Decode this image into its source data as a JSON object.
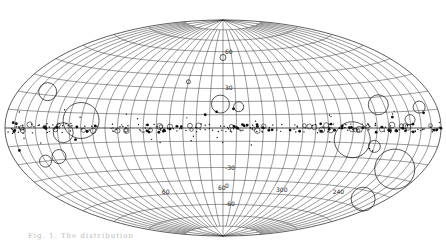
{
  "figure": {
    "projection": "Hammer-Aitoff galactic coordinates",
    "caption": "Fig. 1.  The distribution",
    "latitude_labels": [
      {
        "value": "60",
        "lon": 0,
        "lat": 60
      },
      {
        "value": "30",
        "lon": 0,
        "lat": 30
      },
      {
        "value": "-30",
        "lon": 0,
        "lat": -30
      },
      {
        "value": "0",
        "lon": 0,
        "lat": -45
      },
      {
        "value": "-60",
        "lon": 0,
        "lat": -60
      }
    ],
    "longitude_labels": [
      {
        "value": "60",
        "lon": 60,
        "lat": -50
      },
      {
        "value": "60",
        "lon": 0,
        "lat": -48
      },
      {
        "value": "300",
        "lon": -60,
        "lat": -48
      },
      {
        "value": "240",
        "lon": -120,
        "lat": -45
      }
    ],
    "colors": {
      "grid": "#333333",
      "markers": "#111111",
      "background": "#ffffff"
    }
  },
  "chart_data": {
    "type": "scatter",
    "title": "",
    "xlabel": "galactic longitude",
    "ylabel": "galactic latitude",
    "grid": true,
    "meridian_step_deg": 10,
    "parallel_step_deg": 10,
    "circles": [
      {
        "lon": 150,
        "lat": 22,
        "r": 9
      },
      {
        "lon": 2,
        "lat": 18,
        "r": 9
      },
      {
        "lon": -12,
        "lat": 16,
        "r": 5
      },
      {
        "lon": -125,
        "lat": 15,
        "r": 10
      },
      {
        "lon": -162,
        "lat": 12,
        "r": 6
      },
      {
        "lon": -150,
        "lat": 5,
        "r": 5
      },
      {
        "lon": 110,
        "lat": 5,
        "r": 18
      },
      {
        "lon": 125,
        "lat": -3,
        "r": 10
      },
      {
        "lon": 150,
        "lat": -20,
        "r": 6
      },
      {
        "lon": 135,
        "lat": -18,
        "r": 7
      },
      {
        "lon": -100,
        "lat": -8,
        "r": 18
      },
      {
        "lon": -120,
        "lat": -12,
        "r": 6
      },
      {
        "lon": -150,
        "lat": -25,
        "r": 20
      },
      {
        "lon": -155,
        "lat": -45,
        "r": 12
      },
      {
        "lon": 0,
        "lat": 55,
        "r": 3
      },
      {
        "lon": 30,
        "lat": 35,
        "r": 2
      }
    ]
  }
}
